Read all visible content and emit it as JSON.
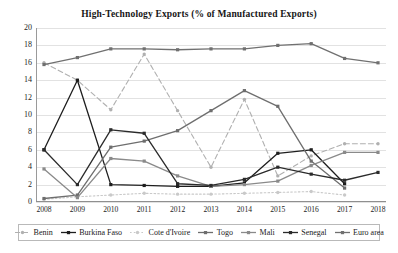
{
  "chart_data": {
    "type": "line",
    "title": "High-Technology Exports (% of Manufactured Exports)",
    "xlabel": "",
    "ylabel": "",
    "categories": [
      "2008",
      "2009",
      "2010",
      "2011",
      "2012",
      "2013",
      "2014",
      "2015",
      "2016",
      "2017",
      "2018"
    ],
    "x": [
      2008,
      2009,
      2010,
      2011,
      2012,
      2013,
      2014,
      2015,
      2016,
      2017,
      2018
    ],
    "ylim": [
      0,
      20
    ],
    "ytick_values": [
      0,
      2,
      4,
      6,
      8,
      10,
      12,
      14,
      16,
      18,
      20
    ],
    "grid": true,
    "legend_position": "bottom",
    "series": [
      {
        "name": "Benin",
        "color": "#b0b0b0",
        "style": "dashed",
        "marker": "circle",
        "values": [
          16.0,
          14.0,
          10.6,
          17.0,
          10.5,
          4.0,
          11.8,
          3.0,
          5.3,
          6.7,
          6.7
        ]
      },
      {
        "name": "Burkina Faso",
        "color": "#1e1e1e",
        "style": "solid",
        "marker": "square",
        "values": [
          6.0,
          14.0,
          2.0,
          1.9,
          1.8,
          1.8,
          2.2,
          5.6,
          6.0,
          2.1,
          null
        ]
      },
      {
        "name": "Cote d'Ivoire",
        "color": "#c9c9c9",
        "style": "dotted",
        "marker": "circle",
        "values": [
          0.3,
          0.6,
          0.8,
          1.0,
          0.9,
          0.9,
          1.0,
          1.1,
          1.2,
          0.8,
          null
        ]
      },
      {
        "name": "Togo",
        "color": "#6e6e6e",
        "style": "solid",
        "marker": "square",
        "values": [
          0.4,
          0.8,
          6.3,
          7.0,
          8.2,
          10.5,
          12.8,
          11.0,
          4.7,
          1.6,
          null
        ]
      },
      {
        "name": "Mali",
        "color": "#8a8a8a",
        "style": "solid",
        "marker": "square",
        "values": [
          3.8,
          0.5,
          5.0,
          4.7,
          3.0,
          1.8,
          2.0,
          2.4,
          4.2,
          5.7,
          5.7
        ]
      },
      {
        "name": "Senegal",
        "color": "#2b2b2b",
        "style": "solid",
        "marker": "square",
        "values": [
          6.0,
          2.0,
          8.3,
          7.9,
          2.1,
          1.9,
          2.6,
          4.0,
          3.2,
          2.5,
          3.4
        ]
      },
      {
        "name": "Euro area",
        "color": "#707070",
        "style": "solid",
        "marker": "square",
        "values": [
          15.8,
          16.6,
          17.6,
          17.6,
          17.5,
          17.6,
          17.6,
          18.0,
          18.2,
          16.5,
          16.0
        ]
      }
    ]
  },
  "legend": {
    "items": [
      {
        "label": "Benin"
      },
      {
        "label": "Burkina Faso"
      },
      {
        "label": "Cote d'Ivoire"
      },
      {
        "label": "Togo"
      },
      {
        "label": "Mali"
      },
      {
        "label": "Senegal"
      },
      {
        "label": "Euro area"
      }
    ]
  }
}
